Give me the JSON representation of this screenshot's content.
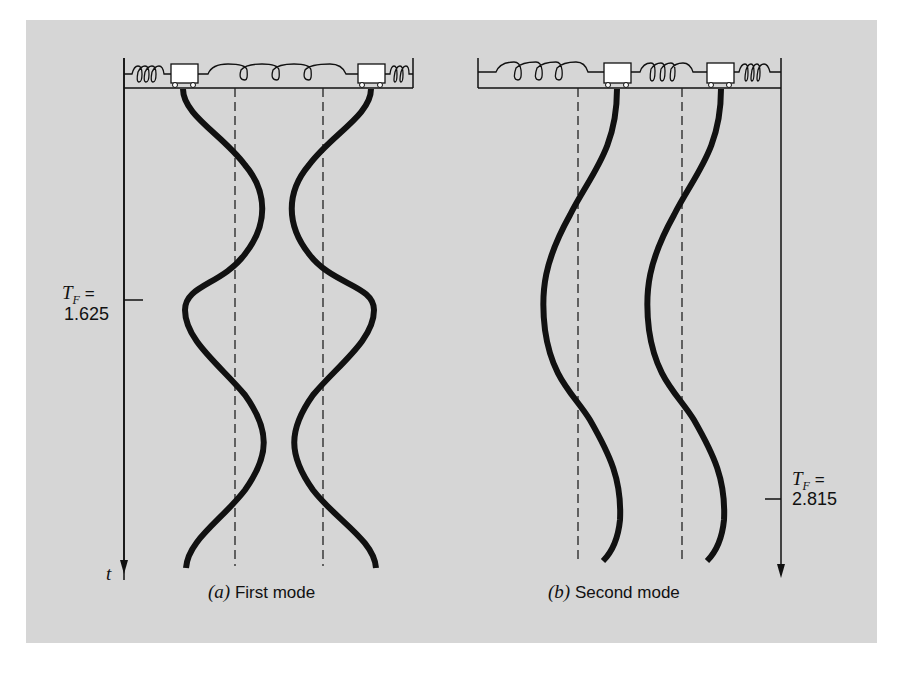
{
  "figure": {
    "background_color": "#d6d6d6",
    "ink_color": "#111111",
    "panel_a": {
      "caption_letter": "(a)",
      "caption_text": "First mode",
      "axis_label": "t",
      "marker_label_var": "T",
      "marker_label_sub": "F",
      "marker_label_eq": "=",
      "marker_value": "1.625",
      "masses": 2,
      "springs": [
        "outer-left",
        "middle-coupling",
        "outer-right"
      ]
    },
    "panel_b": {
      "caption_letter": "(b)",
      "caption_text": "Second mode",
      "marker_label_var": "T",
      "marker_label_sub": "F",
      "marker_label_eq": "=",
      "marker_value": "2.815",
      "masses": 2,
      "springs": [
        "outer-left",
        "middle-coupling",
        "outer-right"
      ]
    }
  }
}
